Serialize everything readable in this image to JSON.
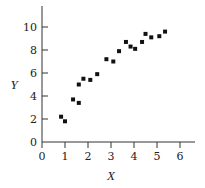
{
  "chart_data": {
    "type": "scatter",
    "title": "",
    "xlabel": "X",
    "ylabel": "Y",
    "xlim": [
      0,
      6.6
    ],
    "ylim": [
      0,
      11.5
    ],
    "xticks": [
      0,
      1,
      2,
      3,
      4,
      5,
      6
    ],
    "yticks": [
      0,
      2,
      4,
      6,
      8,
      10
    ],
    "grid": false,
    "legend": null,
    "marker": "square",
    "marker_color": "#111111",
    "points": [
      {
        "x": 0.83,
        "y": 2.2
      },
      {
        "x": 1.0,
        "y": 1.8
      },
      {
        "x": 1.35,
        "y": 3.7
      },
      {
        "x": 1.6,
        "y": 3.4
      },
      {
        "x": 1.6,
        "y": 5.0
      },
      {
        "x": 1.8,
        "y": 5.5
      },
      {
        "x": 2.1,
        "y": 5.4
      },
      {
        "x": 2.4,
        "y": 5.9
      },
      {
        "x": 2.8,
        "y": 7.2
      },
      {
        "x": 3.1,
        "y": 7.0
      },
      {
        "x": 3.35,
        "y": 7.9
      },
      {
        "x": 3.65,
        "y": 8.7
      },
      {
        "x": 3.85,
        "y": 8.3
      },
      {
        "x": 4.05,
        "y": 8.1
      },
      {
        "x": 4.35,
        "y": 8.7
      },
      {
        "x": 4.5,
        "y": 9.4
      },
      {
        "x": 4.75,
        "y": 9.1
      },
      {
        "x": 5.1,
        "y": 9.2
      },
      {
        "x": 5.35,
        "y": 9.6
      }
    ]
  },
  "axes": {
    "x_label": "X",
    "y_label": "Y",
    "x_tick_labels": [
      "0",
      "1",
      "2",
      "3",
      "4",
      "5",
      "6"
    ],
    "y_tick_labels": [
      "0",
      "2",
      "4",
      "6",
      "8",
      "10"
    ]
  }
}
